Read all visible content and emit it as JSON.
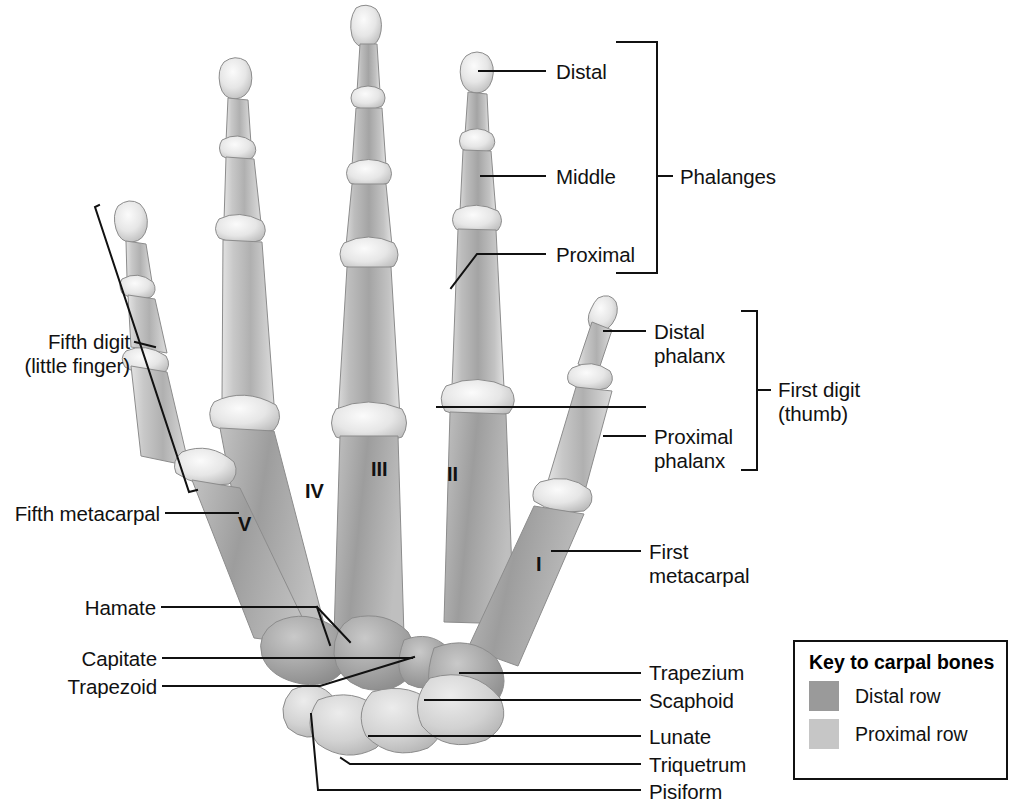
{
  "figure": {
    "background": "#ffffff",
    "line_color": "#111111",
    "text_color": "#111111"
  },
  "bone_shading": {
    "distal_row_fill": "#9a9a9a",
    "proximal_row_fill": "#c6c6c6",
    "shaft_mid": "#b6b6b6",
    "shaft_dark": "#8e8e8e",
    "epiphysis_light": "#ededed",
    "outline": "#7a7a7a"
  },
  "labels": {
    "right_upper": [
      {
        "name": "distal",
        "text": "Distal"
      },
      {
        "name": "middle",
        "text": "Middle"
      },
      {
        "name": "proximal",
        "text": "Proximal"
      }
    ],
    "bracket_phalanges": {
      "name": "phalanges",
      "text": "Phalanges"
    },
    "right_thumb": [
      {
        "name": "distal-phalanx",
        "line1": "Distal",
        "line2": "phalanx"
      },
      {
        "name": "proximal-phalanx",
        "line1": "Proximal",
        "line2": "phalanx"
      }
    ],
    "bracket_first_digit": {
      "name": "first-digit",
      "line1": "First digit",
      "line2": "(thumb)"
    },
    "left": [
      {
        "name": "fifth-digit",
        "line1": "Fifth digit",
        "line2": "(little finger)"
      },
      {
        "name": "fifth-metacarpal",
        "text": "Fifth metacarpal"
      },
      {
        "name": "hamate",
        "text": "Hamate"
      },
      {
        "name": "capitate",
        "text": "Capitate"
      },
      {
        "name": "trapezoid",
        "text": "Trapezoid"
      }
    ],
    "right_lower": [
      {
        "name": "first-metacarpal",
        "line1": "First",
        "line2": "metacarpal"
      },
      {
        "name": "trapezium",
        "text": "Trapezium"
      },
      {
        "name": "scaphoid",
        "text": "Scaphoid"
      },
      {
        "name": "lunate",
        "text": "Lunate"
      },
      {
        "name": "triquetrum",
        "text": "Triquetrum"
      },
      {
        "name": "pisiform",
        "text": "Pisiform"
      }
    ]
  },
  "metacarpal_numerals": [
    {
      "name": "numeral-v",
      "text": "V"
    },
    {
      "name": "numeral-iv",
      "text": "IV"
    },
    {
      "name": "numeral-iii",
      "text": "III"
    },
    {
      "name": "numeral-ii",
      "text": "II"
    },
    {
      "name": "numeral-i",
      "text": "I"
    }
  ],
  "key": {
    "title": "Key to carpal bones",
    "rows": [
      {
        "name": "distal-row",
        "label": "Distal row",
        "color": "#9a9a9a"
      },
      {
        "name": "proximal-row",
        "label": "Proximal row",
        "color": "#c6c6c6"
      }
    ]
  }
}
